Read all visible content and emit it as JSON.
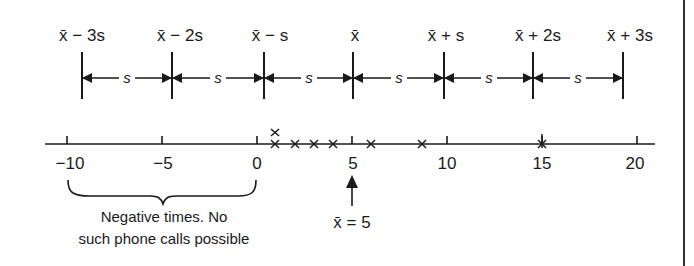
{
  "diagram": {
    "interval_labels": [
      "x̄ − 3s",
      "x̄ − 2s",
      "x̄ − s",
      "x̄",
      "x̄ + s",
      "x̄ + 2s",
      "x̄ + 3s"
    ],
    "spacing_label": "s",
    "axis": {
      "ticks": [
        -10,
        -5,
        0,
        5,
        10,
        15,
        20
      ],
      "tick_labels": [
        "−10",
        "−5",
        "0",
        "5",
        "10",
        "15",
        "20"
      ]
    },
    "data_points": [
      1,
      1,
      2,
      3,
      4,
      6,
      8.7,
      15
    ],
    "mean_annotation": {
      "label": "x̄ = 5",
      "value": 5
    },
    "brace_annotation": {
      "line1": "Negative times. No",
      "line2": "such phone calls possible",
      "range": [
        -10,
        0
      ]
    },
    "colors": {
      "ink": "#1a1a1a",
      "background": "#ffffff"
    }
  }
}
